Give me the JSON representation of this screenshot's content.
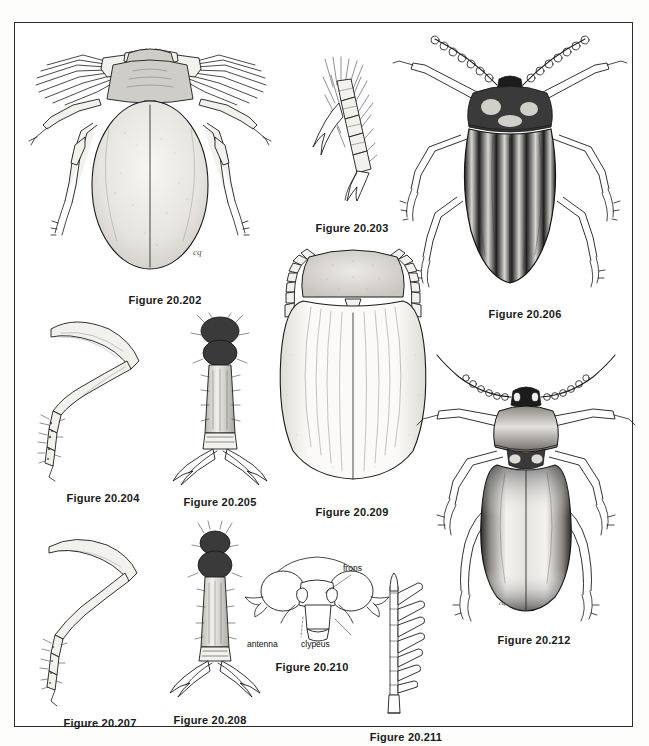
{
  "plate": {
    "title": "Beetle identification figure plate",
    "border_color": "#2b2b2b",
    "background_color": "#ffffff",
    "ink_color": "#1b1b1b"
  },
  "figures": [
    {
      "id": "fig-20-202",
      "caption": "Figure 20.202",
      "subject": "dorsal view of water scavenger beetle with fringed swimming legs",
      "caption_x": 150,
      "caption_y": 277
    },
    {
      "id": "fig-20-203",
      "caption": "Figure 20.203",
      "subject": "hind tarsus with claws and swimming hairs",
      "caption_x": 337,
      "caption_y": 205
    },
    {
      "id": "fig-20-206",
      "caption": "Figure 20.206",
      "subject": "dorsal view of striped leaf beetle, Colorado potato beetle type",
      "caption_x": 510,
      "caption_y": 291
    },
    {
      "id": "fig-20-204",
      "caption": "Figure 20.204",
      "subject": "lateral view of hind leg, femur and tibia",
      "caption_x": 88,
      "caption_y": 475
    },
    {
      "id": "fig-20-205",
      "caption": "Figure 20.205",
      "subject": "tarsus with paired tarsal claws, enlarged",
      "caption_x": 205,
      "caption_y": 479
    },
    {
      "id": "fig-20-209",
      "caption": "Figure 20.209",
      "subject": "dorsal view of beetle, pronotum and striate elytra",
      "caption_x": 337,
      "caption_y": 489
    },
    {
      "id": "fig-20-212",
      "caption": "Figure 20.212",
      "subject": "dorsal view of flea beetle with stout hind femora",
      "caption_x": 519,
      "caption_y": 617
    },
    {
      "id": "fig-20-207",
      "caption": "Figure 20.207",
      "subject": "lateral view of hind leg, slender form",
      "caption_x": 85,
      "caption_y": 700
    },
    {
      "id": "fig-20-208",
      "caption": "Figure 20.208",
      "subject": "tarsus with paired claws, slender form",
      "caption_x": 195,
      "caption_y": 697
    },
    {
      "id": "fig-20-210",
      "caption": "Figure 20.210",
      "subject": "anterior view of beetle head showing frons, antenna and clypeus",
      "caption_x": 297,
      "caption_y": 644
    },
    {
      "id": "fig-20-211",
      "caption": "Figure 20.211",
      "subject": "serrate antenna",
      "caption_x": 391,
      "caption_y": 714
    }
  ],
  "annotations": {
    "head_diagram": [
      {
        "label": "frons",
        "x": 330,
        "y": 546
      },
      {
        "label": "antenna",
        "x": 253,
        "y": 622
      },
      {
        "label": "clypeus",
        "x": 305,
        "y": 622
      }
    ]
  },
  "artist_signature": "cq"
}
